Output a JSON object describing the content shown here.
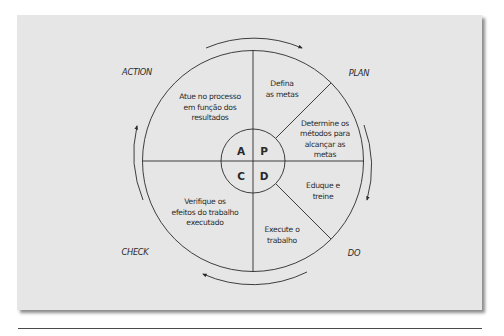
{
  "diagram": {
    "type": "PDCA cycle",
    "stages": {
      "plan": "PLAN",
      "do": "DO",
      "check": "CHECK",
      "action": "ACTION"
    },
    "center_letters": {
      "a": "A",
      "p": "P",
      "c": "C",
      "d": "D"
    },
    "segments": {
      "action": [
        "Atue no processo",
        "em função dos",
        "resultados"
      ],
      "plan_goals": [
        "Defina",
        "as metas"
      ],
      "plan_methods": [
        "Determine os",
        "métodos para",
        "alcançar as",
        "metas"
      ],
      "do_train": [
        "Eduque e",
        "treine"
      ],
      "do_execute": [
        "Execute o",
        "trabalho"
      ],
      "check": [
        "Verifique os",
        "efeitos do trabalho",
        "executado"
      ]
    },
    "arrows": [
      "clockwise-top",
      "clockwise-right",
      "clockwise-bottom",
      "clockwise-left"
    ],
    "colors": {
      "panel": "#e6e6e6",
      "stroke": "#2a2a2a",
      "text": "#2a2a2a"
    }
  }
}
